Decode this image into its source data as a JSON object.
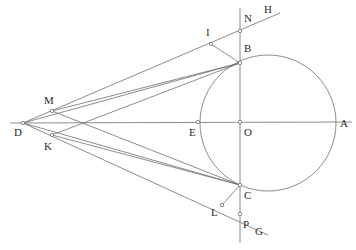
{
  "figure": {
    "type": "geometry-diagram",
    "background": "#ffffff",
    "stroke_color": "#6e6e6e",
    "label_color": "#2b2b2b",
    "width": 356,
    "height": 250,
    "circle": {
      "cx": 268,
      "cy": 123,
      "r": 68
    },
    "points": [
      {
        "id": "A",
        "label": "A",
        "x": 336,
        "y": 122,
        "label_x": 340,
        "label_y": 118,
        "marker": false
      },
      {
        "id": "B",
        "label": "B",
        "x": 240,
        "y": 63,
        "label_x": 244,
        "label_y": 43,
        "marker": true
      },
      {
        "id": "C",
        "label": "C",
        "x": 240,
        "y": 185,
        "label_x": 244,
        "label_y": 190,
        "marker": true
      },
      {
        "id": "D",
        "label": "D",
        "x": 23,
        "y": 123,
        "label_x": 14,
        "label_y": 127,
        "marker": true
      },
      {
        "id": "E",
        "label": "E",
        "x": 198,
        "y": 122,
        "label_x": 189,
        "label_y": 127,
        "marker": true
      },
      {
        "id": "G",
        "label": "G",
        "x": 268,
        "y": 235,
        "label_x": 255,
        "label_y": 226,
        "marker": false
      },
      {
        "id": "H",
        "label": "H",
        "x": 280,
        "y": 13,
        "label_x": 264,
        "label_y": 4,
        "marker": false
      },
      {
        "id": "I",
        "label": "I",
        "x": 211,
        "y": 44,
        "label_x": 206,
        "label_y": 27,
        "marker": true
      },
      {
        "id": "K",
        "label": "K",
        "x": 52,
        "y": 135,
        "label_x": 44,
        "label_y": 141,
        "marker": true
      },
      {
        "id": "L",
        "label": "L",
        "x": 222,
        "y": 205,
        "label_x": 211,
        "label_y": 207,
        "marker": true
      },
      {
        "id": "M",
        "label": "M",
        "x": 52,
        "y": 111,
        "label_x": 44,
        "label_y": 95,
        "marker": true
      },
      {
        "id": "N",
        "label": "N",
        "x": 240,
        "y": 31,
        "label_x": 244,
        "label_y": 13,
        "marker": true
      },
      {
        "id": "O",
        "label": "O",
        "x": 240,
        "y": 122,
        "label_x": 244,
        "label_y": 127,
        "marker": true
      },
      {
        "id": "P",
        "label": "P",
        "x": 240,
        "y": 214,
        "label_x": 243,
        "label_y": 219,
        "marker": true
      }
    ],
    "segments": [
      {
        "name": "line-D-A-horizontal",
        "x1": 10,
        "y1": 123,
        "x2": 352,
        "y2": 122
      },
      {
        "name": "line-N-P-vertical",
        "x1": 240,
        "y1": 8,
        "x2": 240,
        "y2": 243
      },
      {
        "name": "line-D-I-H-upper-secant",
        "x1": 23,
        "y1": 123,
        "x2": 280,
        "y2": 13
      },
      {
        "name": "line-D-B-tangent-upper",
        "x1": 23,
        "y1": 123,
        "x2": 240,
        "y2": 63
      },
      {
        "name": "line-D-C-tangent-lower",
        "x1": 23,
        "y1": 123,
        "x2": 240,
        "y2": 185
      },
      {
        "name": "line-D-L-G-lower-secant",
        "x1": 23,
        "y1": 123,
        "x2": 268,
        "y2": 235
      },
      {
        "name": "line-M-B-chordal",
        "x1": 52,
        "y1": 111,
        "x2": 240,
        "y2": 63
      },
      {
        "name": "line-K-C-chordal",
        "x1": 52,
        "y1": 135,
        "x2": 240,
        "y2": 185
      },
      {
        "name": "line-I-B-short",
        "x1": 211,
        "y1": 44,
        "x2": 240,
        "y2": 63
      },
      {
        "name": "line-L-C-short",
        "x1": 222,
        "y1": 205,
        "x2": 240,
        "y2": 185
      },
      {
        "name": "line-M-K-left-cross",
        "x1": 52,
        "y1": 111,
        "x2": 240,
        "y2": 185
      },
      {
        "name": "line-K-M-left-cross-2",
        "x1": 52,
        "y1": 135,
        "x2": 240,
        "y2": 63
      }
    ]
  }
}
